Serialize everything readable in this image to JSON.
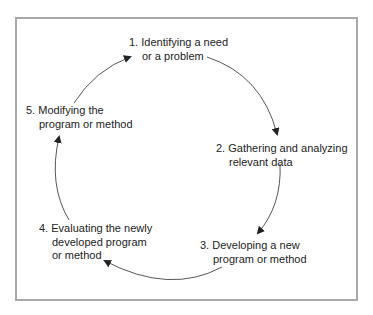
{
  "diagram": {
    "type": "cycle",
    "border_color": "#a8a8a8",
    "steps": [
      {
        "number": "1.",
        "line1": "Identifying a need",
        "lines": [
          "or a problem"
        ]
      },
      {
        "number": "2.",
        "line1": "Gathering and analyzing",
        "lines": [
          "relevant data"
        ]
      },
      {
        "number": "3.",
        "line1": "Developing a new",
        "lines": [
          "program or method"
        ]
      },
      {
        "number": "4.",
        "line1": "Evaluating the newly",
        "lines": [
          "developed program",
          "or method"
        ]
      },
      {
        "number": "5.",
        "line1": "Modifying the",
        "lines": [
          "program or method"
        ]
      }
    ],
    "arrows": [
      {
        "from": "1",
        "to": "2"
      },
      {
        "from": "2",
        "to": "3"
      },
      {
        "from": "3",
        "to": "4"
      },
      {
        "from": "4",
        "to": "5"
      },
      {
        "from": "5",
        "to": "1"
      }
    ]
  }
}
